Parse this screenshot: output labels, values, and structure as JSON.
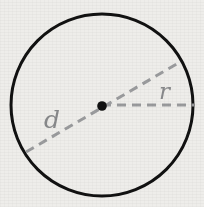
{
  "figure": {
    "kind": "geometry-diagram",
    "canvas": {
      "width": 204,
      "height": 207
    },
    "background_color": "#eeedea",
    "circle": {
      "name": "circle-outline",
      "center_x": 102,
      "center_y": 105,
      "radius": 91,
      "stroke_color": "#111111",
      "stroke_width": 3,
      "fill": "none"
    },
    "center_point": {
      "name": "center-dot",
      "x": 102,
      "y": 106,
      "radius": 4.8,
      "fill_color": "#111111"
    },
    "diameter": {
      "label": "d",
      "stroke_color": "#9a9b9d",
      "stroke_width": 3,
      "dash_pattern": "9 6",
      "x1": 26,
      "y1": 152,
      "x2": 180,
      "y2": 62
    },
    "radius_segment": {
      "label": "r",
      "stroke_color": "#9a9b9d",
      "stroke_width": 3,
      "dash_pattern": "9 6",
      "x1": 102,
      "y1": 105,
      "x2": 194,
      "y2": 105
    },
    "labels": {
      "diameter_label": "d",
      "radius_label": "r",
      "label_color": "#87888a"
    }
  }
}
